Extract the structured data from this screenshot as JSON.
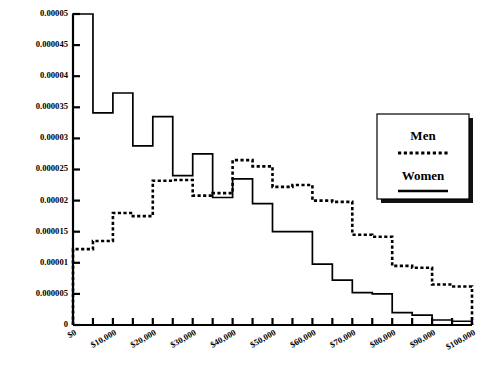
{
  "chart_data": {
    "type": "line",
    "title": "",
    "subtitle": "",
    "xlabel": "",
    "ylabel": "",
    "grid": false,
    "legend_position": "right",
    "xlim": [
      0,
      100000
    ],
    "ylim": [
      0,
      5e-05
    ],
    "bin_width": 5000,
    "x_tick_labels": [
      "$0",
      "$10,000",
      "$20,000",
      "$30,000",
      "$40,000",
      "$50,000",
      "$60,000",
      "$70,000",
      "$80,000",
      "$90,000",
      "$100,000"
    ],
    "x_tick_values": [
      0,
      10000,
      20000,
      30000,
      40000,
      50000,
      60000,
      70000,
      80000,
      90000,
      100000
    ],
    "y_tick_labels": [
      "0",
      "0.000005",
      "0.00001",
      "0.000015",
      "0.00002",
      "0.000025",
      "0.00003",
      "0.000035",
      "0.00004",
      "0.000045",
      "0.00005"
    ],
    "y_tick_values": [
      0,
      5e-06,
      1e-05,
      1.5e-05,
      2e-05,
      2.5e-05,
      3e-05,
      3.5e-05,
      4e-05,
      4.5e-05,
      5e-05
    ],
    "bin_edges": [
      0,
      5000,
      10000,
      15000,
      20000,
      25000,
      30000,
      35000,
      40000,
      45000,
      50000,
      55000,
      60000,
      65000,
      70000,
      75000,
      80000,
      85000,
      90000,
      95000,
      100000
    ],
    "bin_centers": [
      2500,
      7500,
      12500,
      17500,
      22500,
      27500,
      32500,
      37500,
      42500,
      47500,
      52500,
      57500,
      62500,
      67500,
      72500,
      77500,
      82500,
      87500,
      92500,
      97500
    ],
    "series": [
      {
        "name": "Women",
        "style": "solid",
        "color": "#000000",
        "values": [
          5e-05,
          3.41e-05,
          3.73e-05,
          2.88e-05,
          3.35e-05,
          2.4e-05,
          2.75e-05,
          2.05e-05,
          2.35e-05,
          1.95e-05,
          1.5e-05,
          1.5e-05,
          9.8e-06,
          7.2e-06,
          5.2e-06,
          5e-06,
          2e-06,
          1.6e-06,
          8e-07,
          6e-07
        ]
      },
      {
        "name": "Men",
        "style": "dotted",
        "color": "#000000",
        "values": [
          1.22e-05,
          1.35e-05,
          1.8e-05,
          1.75e-05,
          2.32e-05,
          2.33e-05,
          2.08e-05,
          2.12e-05,
          2.65e-05,
          2.55e-05,
          2.22e-05,
          2.25e-05,
          2e-05,
          1.98e-05,
          1.45e-05,
          1.42e-05,
          9.5e-06,
          9.2e-06,
          6.5e-06,
          6.2e-06
        ]
      }
    ]
  },
  "legend": {
    "men_label": "Men",
    "women_label": "Women"
  },
  "axes": {
    "y_title": "",
    "x_title": ""
  }
}
